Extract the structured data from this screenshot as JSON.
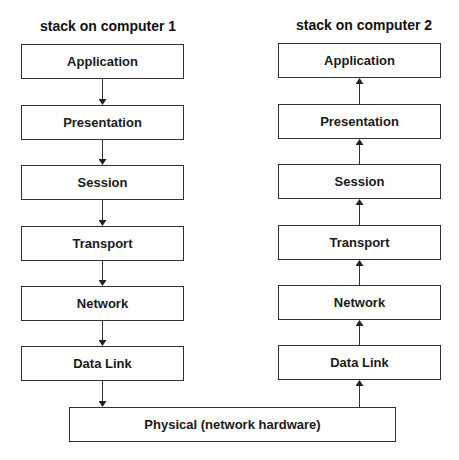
{
  "stack1": {
    "title": "stack on computer 1",
    "layers": [
      "Application",
      "Presentation",
      "Session",
      "Transport",
      "Network",
      "Data Link"
    ],
    "direction": "down"
  },
  "stack2": {
    "title": "stack on computer 2",
    "layers": [
      "Application",
      "Presentation",
      "Session",
      "Transport",
      "Network",
      "Data Link"
    ],
    "direction": "up"
  },
  "physical": {
    "label": "Physical (network hardware)"
  }
}
